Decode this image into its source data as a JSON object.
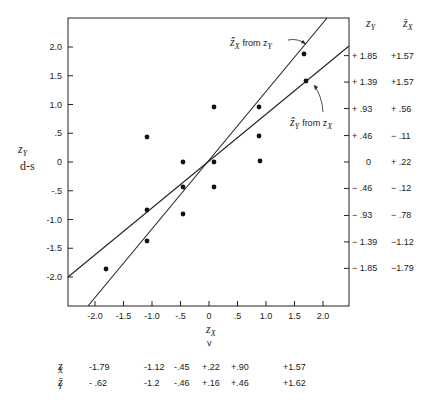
{
  "chart_data": {
    "type": "scatter",
    "title": "",
    "xlabel": "z_X",
    "xlabel_sub": "v",
    "ylabel": "z_Y",
    "ylabel_sub": "d-s",
    "xlim": [
      -2.5,
      2.45
    ],
    "ylim": [
      -2.5,
      2.5
    ],
    "x_ticks": [
      "-2.0",
      "-1.5",
      "-1.0",
      "-.5",
      "0",
      ".5",
      "1.0",
      "1.5",
      "2.0"
    ],
    "y_ticks": [
      "2.0",
      "1.5",
      "1.0",
      ".5",
      "0",
      "-.5",
      "-1.0",
      "-1.5",
      "-2.0"
    ],
    "grid": false,
    "points": [
      {
        "x": -1.79,
        "y": -1.85
      },
      {
        "x": -1.12,
        "y": 0.46
      },
      {
        "x": -1.12,
        "y": -0.93
      },
      {
        "x": -1.12,
        "y": -1.39
      },
      {
        "x": -0.45,
        "y": 0.0
      },
      {
        "x": -0.45,
        "y": -0.46
      },
      {
        "x": -0.45,
        "y": -0.93
      },
      {
        "x": 0.22,
        "y": 0.93
      },
      {
        "x": 0.22,
        "y": 0.0
      },
      {
        "x": 0.22,
        "y": -0.46
      },
      {
        "x": 0.9,
        "y": 0.93
      },
      {
        "x": 0.9,
        "y": 0.46
      },
      {
        "x": 0.9,
        "y": 0.0
      },
      {
        "x": 1.57,
        "y": 1.85
      },
      {
        "x": 1.57,
        "y": 1.39
      }
    ],
    "lines": [
      {
        "name": "ẑY from zX",
        "label_main": "ẑ",
        "label_sub": "Y",
        "label_from": "from z",
        "label_from_sub": "X",
        "x1": -2.5,
        "y1": -2.0,
        "x2": 2.45,
        "y2": 2.0
      },
      {
        "name": "ẑX from zY",
        "label_main": "ẑ",
        "label_sub": "X",
        "label_from": "from z",
        "label_from_sub": "Y",
        "x1": -2.15,
        "y1": -2.5,
        "x2": 2.05,
        "y2": 2.5
      }
    ],
    "right_table": {
      "headers": [
        "z_Y",
        "z̄_X"
      ],
      "rows": [
        [
          "+ 1.85",
          "+1.57"
        ],
        [
          "+ 1.39",
          "+1.57"
        ],
        [
          "+ .93",
          "+ .56"
        ],
        [
          "+ .46",
          "− .11"
        ],
        [
          "0",
          "+ .22"
        ],
        [
          "− .46",
          "− .12"
        ],
        [
          "− .93",
          "− .78"
        ],
        [
          "− 1.39",
          "−1.12"
        ],
        [
          "− 1.85",
          "−1.79"
        ]
      ]
    },
    "bottom_table": {
      "row1_label": "z_X",
      "row1_values": [
        "-1.79",
        "-1.12",
        "-.45",
        "+.22",
        "+.90",
        "+1.57"
      ],
      "row2_label": "z̄_Y",
      "row2_values": [
        "- .62",
        "-1.2",
        "-.46",
        "+.16",
        "+.46",
        "+1.62"
      ]
    }
  },
  "labels": {
    "ylabel_main": "z",
    "ylabel_sub": "Y",
    "ylabel_note": "d-s",
    "xlabel_main": "z",
    "xlabel_sub": "X",
    "xlabel_note": "v",
    "right_header_1_main": "z",
    "right_header_1_sub": "Y",
    "right_header_2_main": "z̄",
    "right_header_2_sub": "X",
    "line1_hat": "ẑ",
    "line1_sub": "X",
    "line1_from": "from z",
    "line1_from_sub": "Y",
    "line2_hat": "ẑ",
    "line2_sub": "Y",
    "line2_from": "from z",
    "line2_from_sub": "X",
    "bottom_row1_main": "z",
    "bottom_row1_sub": "X",
    "bottom_row2_main": "z̄",
    "bottom_row2_sub": "Y"
  }
}
